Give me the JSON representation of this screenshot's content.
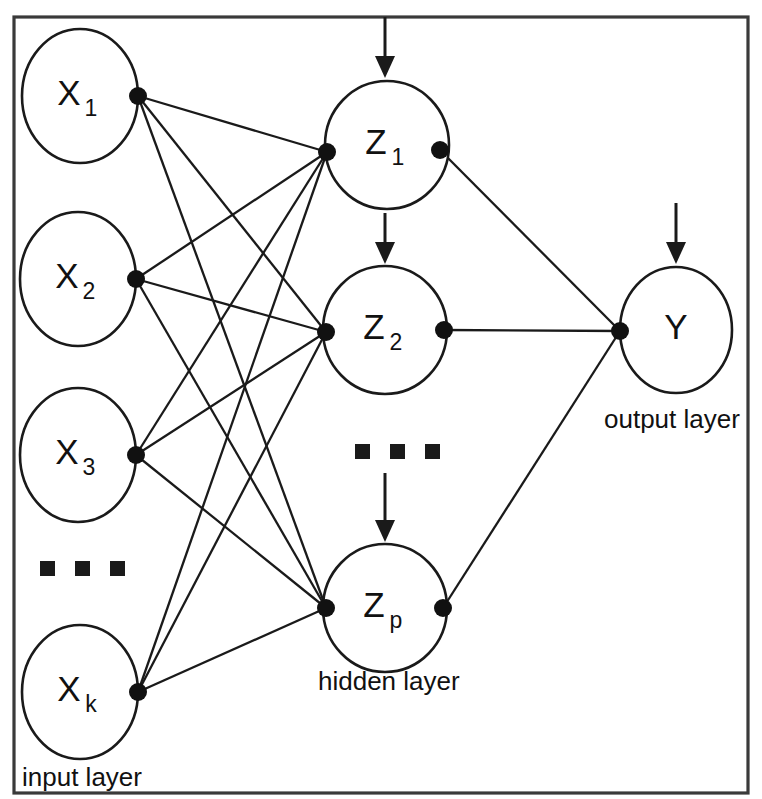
{
  "diagram": {
    "background_color": "#ffffff",
    "stroke_color": "#1a1a1a",
    "frame_color": "#3a3a3a"
  },
  "layers": {
    "input": {
      "label": "input layer",
      "label_x": 22,
      "label_y": 786,
      "ellipsis_count": 3,
      "ellipsis_x": 40,
      "ellipsis_y": 561,
      "nodes": [
        {
          "id": "x1",
          "base": "X",
          "sub": "1",
          "cx": 80,
          "cy": 96,
          "rx": 58,
          "ry": 67,
          "dot_x": 138,
          "dot_y": 96
        },
        {
          "id": "x2",
          "base": "X",
          "sub": "2",
          "cx": 78,
          "cy": 279,
          "rx": 58,
          "ry": 67,
          "dot_x": 136,
          "dot_y": 279
        },
        {
          "id": "x3",
          "base": "X",
          "sub": "3",
          "cx": 78,
          "cy": 455,
          "rx": 58,
          "ry": 67,
          "dot_x": 136,
          "dot_y": 455
        },
        {
          "id": "xk",
          "base": "X",
          "sub": "k",
          "cx": 80,
          "cy": 692,
          "rx": 58,
          "ry": 67,
          "dot_x": 138,
          "dot_y": 692
        }
      ]
    },
    "hidden": {
      "label": "hidden layer",
      "label_x": 318,
      "label_y": 690,
      "ellipsis_count": 3,
      "ellipsis_x": 355,
      "ellipsis_y": 444,
      "nodes": [
        {
          "id": "z1",
          "base": "Z",
          "sub": "1",
          "cx": 387,
          "cy": 145,
          "rx": 62,
          "ry": 64,
          "dot_in_x": 327,
          "dot_in_y": 152,
          "dot_out_x": 440,
          "dot_out_y": 150
        },
        {
          "id": "z2",
          "base": "Z",
          "sub": "2",
          "cx": 385,
          "cy": 330,
          "rx": 62,
          "ry": 64,
          "dot_in_x": 326,
          "dot_in_y": 332,
          "dot_out_x": 444,
          "dot_out_y": 330
        },
        {
          "id": "zp",
          "base": "Z",
          "sub": "p",
          "cx": 385,
          "cy": 608,
          "rx": 62,
          "ry": 64,
          "dot_in_x": 326,
          "dot_in_y": 608,
          "dot_out_x": 443,
          "dot_out_y": 608
        }
      ]
    },
    "output": {
      "label": "output layer",
      "label_x": 604,
      "label_y": 428,
      "nodes": [
        {
          "id": "y",
          "base": "Y",
          "sub": "",
          "cx": 676,
          "cy": 330,
          "rx": 56,
          "ry": 63,
          "dot_x": 620,
          "dot_y": 331
        }
      ]
    }
  },
  "bias_arrows": [
    {
      "id": "arrow-to-z1",
      "x": 385,
      "y_start": 17,
      "y_end": 78,
      "target": "z1"
    },
    {
      "id": "arrow-to-z2",
      "x": 385,
      "y_start": 213,
      "y_end": 264,
      "target": "z2"
    },
    {
      "id": "arrow-to-zp",
      "x": 385,
      "y_start": 473,
      "y_end": 542,
      "target": "zp"
    },
    {
      "id": "arrow-to-y",
      "x": 676,
      "y_start": 203,
      "y_end": 264,
      "target": "y"
    }
  ],
  "connections": {
    "input_to_hidden": [
      {
        "from": "x1",
        "to": "z1"
      },
      {
        "from": "x1",
        "to": "z2"
      },
      {
        "from": "x1",
        "to": "zp"
      },
      {
        "from": "x2",
        "to": "z1"
      },
      {
        "from": "x2",
        "to": "z2"
      },
      {
        "from": "x2",
        "to": "zp"
      },
      {
        "from": "x3",
        "to": "z1"
      },
      {
        "from": "x3",
        "to": "z2"
      },
      {
        "from": "x3",
        "to": "zp"
      },
      {
        "from": "xk",
        "to": "z1"
      },
      {
        "from": "xk",
        "to": "z2"
      },
      {
        "from": "xk",
        "to": "zp"
      }
    ],
    "hidden_to_output": [
      {
        "from": "z1",
        "to": "y"
      },
      {
        "from": "z2",
        "to": "y"
      },
      {
        "from": "zp",
        "to": "y"
      }
    ]
  },
  "frame": {
    "x": 14,
    "y": 17,
    "width": 734,
    "height": 776
  }
}
